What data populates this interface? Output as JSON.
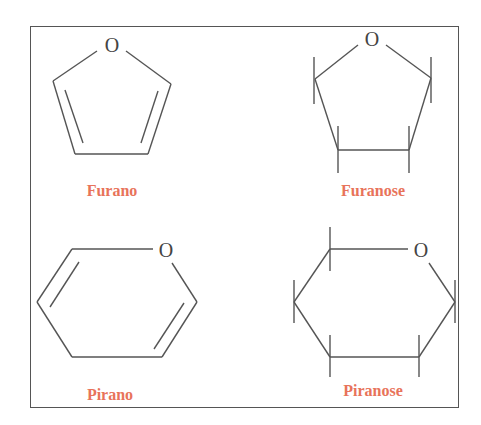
{
  "figure": {
    "label_color": "#e8735a",
    "line_color": "#555555",
    "structures": [
      {
        "name": "Furano",
        "atom": "O"
      },
      {
        "name": "Furanose",
        "atom": "O"
      },
      {
        "name": "Pirano",
        "atom": "O"
      },
      {
        "name": "Piranose",
        "atom": "O"
      }
    ]
  }
}
